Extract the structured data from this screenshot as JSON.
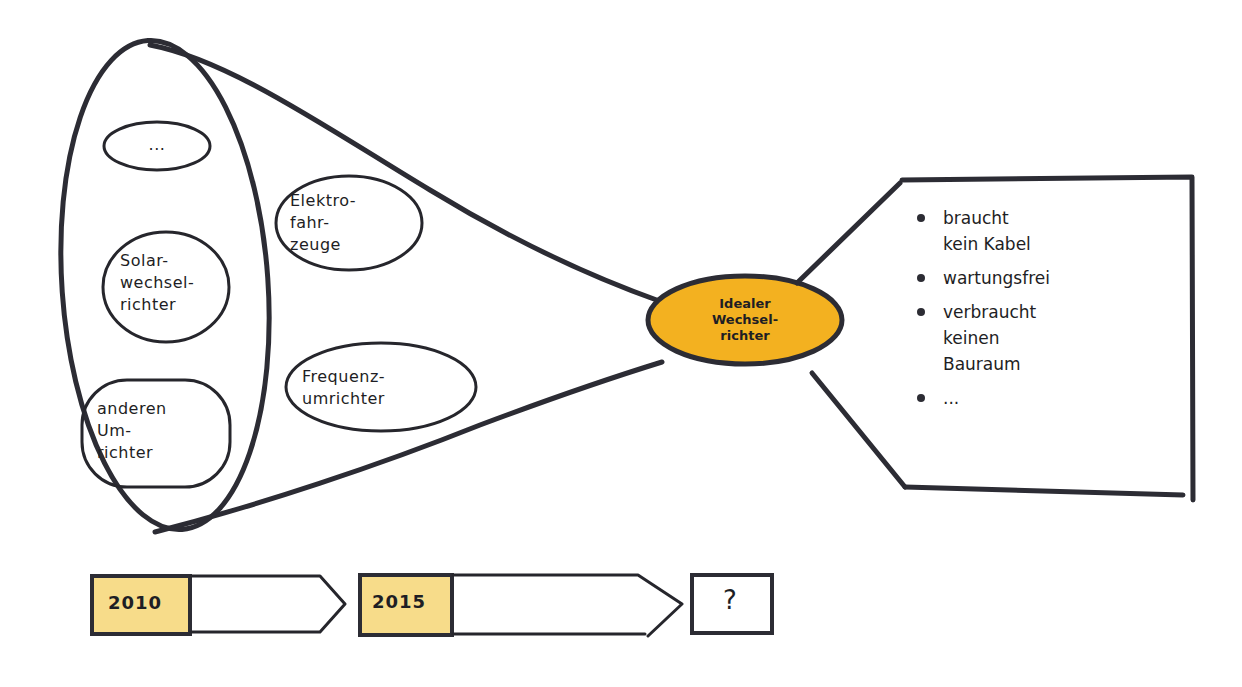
{
  "diagram": {
    "type": "funnel-mindmap",
    "colors": {
      "ink": "#2c2c34",
      "hub_fill": "#f3b120",
      "year_fill": "#f7dc8a",
      "background": "#ffffff"
    },
    "source_group": {
      "items": [
        {
          "id": "ellipsis",
          "label": "..."
        },
        {
          "id": "solar",
          "label": "Solar-\nwechsel-\nrichter"
        },
        {
          "id": "other",
          "label": "anderen\nUm-\nrichter"
        }
      ]
    },
    "funnel_items": [
      {
        "id": "ev",
        "label": "Elektro-\nfahr-\nzeuge"
      },
      {
        "id": "freq",
        "label": "Frequenz-\numrichter"
      }
    ],
    "hub": {
      "label": "Idealer\nWechsel-\nrichter"
    },
    "properties": {
      "items": [
        {
          "label": "braucht\nkein Kabel"
        },
        {
          "label": "wartungsfrei"
        },
        {
          "label": "verbraucht\nkeinen\nBauraum"
        },
        {
          "label": "..."
        }
      ]
    },
    "timeline": {
      "steps": [
        {
          "year": "2010"
        },
        {
          "year": "2015"
        },
        {
          "year": "?"
        }
      ]
    }
  }
}
